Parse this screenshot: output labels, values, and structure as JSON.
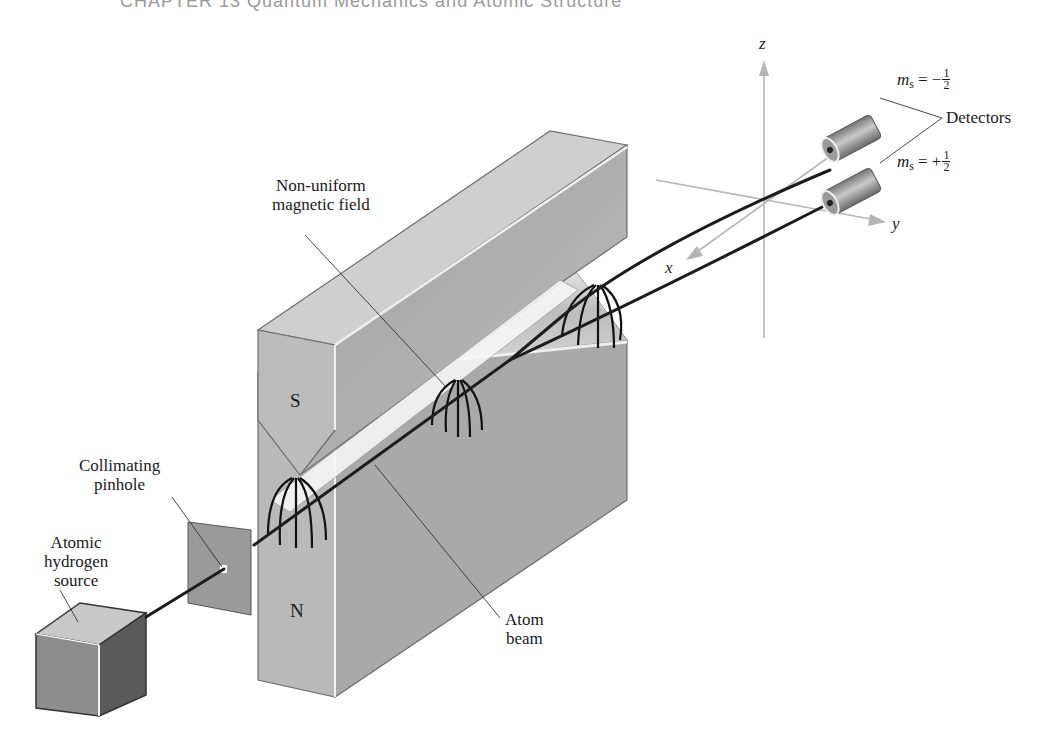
{
  "running_head": "CHAPTER 13   Quantum Mechanics and Atomic Structure",
  "figure": {
    "labels": {
      "nonuniform_field": [
        "Non-uniform",
        "magnetic field"
      ],
      "collimating_pinhole": [
        "Collimating",
        "pinhole"
      ],
      "atomic_hydrogen_source": [
        "Atomic",
        "hydrogen",
        "source"
      ],
      "atom_beam": [
        "Atom",
        "beam"
      ],
      "detectors": "Detectors",
      "south_pole": "S",
      "north_pole": "N"
    },
    "spin_states": [
      {
        "symbol": "m",
        "subscript": "s",
        "sign": "= −",
        "numerator": "1",
        "denominator": "2"
      },
      {
        "symbol": "m",
        "subscript": "s",
        "sign": "= +",
        "numerator": "1",
        "denominator": "2"
      }
    ],
    "axes": {
      "x": "x",
      "y": "y",
      "z": "z"
    },
    "colors": {
      "magnet_front": "#b9b9b9",
      "magnet_side": "#a8a8a8",
      "magnet_top": "#cfcfcf",
      "beam": "#1c1c1c",
      "axis": "#b5b5b5",
      "source_top": "#c8c8c8",
      "source_front": "#8d8d8d",
      "source_side": "#5a5a5a",
      "pinhole_plate": "#9a9a9a"
    }
  }
}
